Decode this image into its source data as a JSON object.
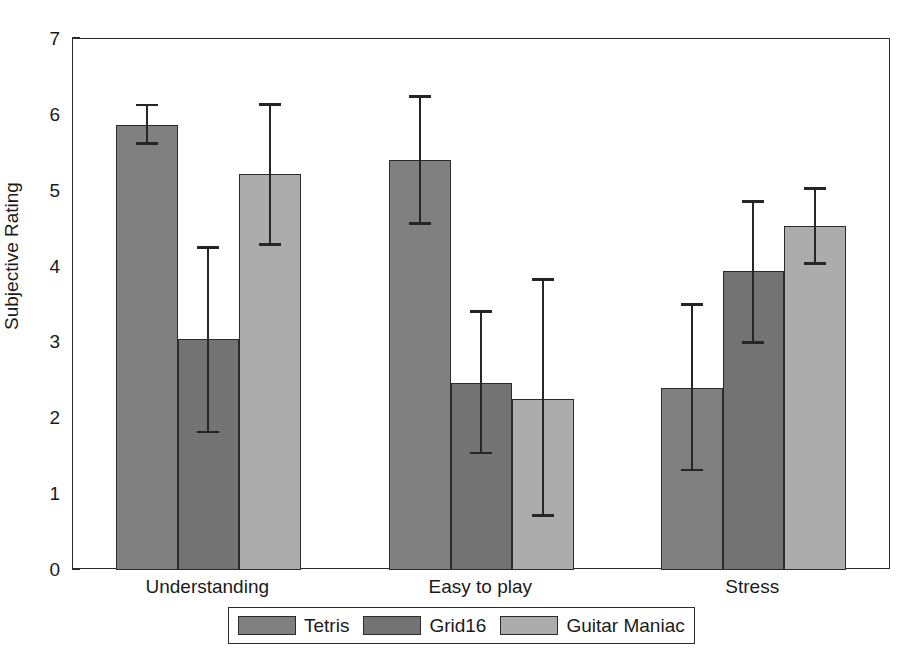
{
  "chart_data": {
    "type": "bar",
    "title": "",
    "subtitle": "",
    "xlabel": "",
    "ylabel": "Subjective Rating",
    "categories": [
      "Understanding",
      "Easy to play",
      "Stress"
    ],
    "ylim": [
      0,
      7
    ],
    "yticks": [
      0,
      1,
      2,
      3,
      4,
      5,
      6,
      7
    ],
    "ytick_labels": [
      "0",
      "1",
      "2",
      "3",
      "4",
      "5",
      "6",
      "7"
    ],
    "grid": false,
    "legend_position": "bottom-outside",
    "error_bars": "asymmetric-range",
    "series": [
      {
        "name": "Tetris",
        "color": "#808080",
        "values": [
          5.87,
          5.41,
          2.4
        ],
        "err_upper": [
          6.13,
          6.24,
          3.5
        ],
        "err_lower": [
          5.62,
          4.57,
          1.32
        ]
      },
      {
        "name": "Grid16",
        "color": "#737373",
        "values": [
          3.04,
          2.46,
          3.94
        ],
        "err_upper": [
          4.25,
          3.41,
          4.86
        ],
        "err_lower": [
          1.82,
          1.54,
          3.0
        ]
      },
      {
        "name": "Guitar Maniac",
        "color": "#acacac",
        "values": [
          5.22,
          2.26,
          4.54
        ],
        "err_upper": [
          6.14,
          3.83,
          5.03
        ],
        "err_lower": [
          4.29,
          0.72,
          4.04
        ]
      }
    ]
  },
  "axes": {
    "y_title": "Subjective Rating",
    "tick_labels": [
      "7",
      "6",
      "5",
      "4",
      "3",
      "2",
      "1",
      "0"
    ]
  },
  "legend": {
    "items": [
      {
        "label": "Tetris",
        "color": "#808080"
      },
      {
        "label": "Grid16",
        "color": "#737373"
      },
      {
        "label": "Guitar Maniac",
        "color": "#acacac"
      }
    ]
  },
  "category_labels": [
    "Understanding",
    "Easy to play",
    "Stress"
  ]
}
